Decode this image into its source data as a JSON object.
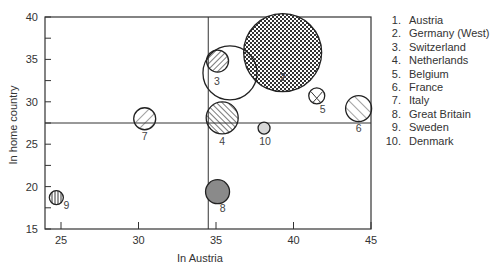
{
  "chart_data": {
    "type": "scatter",
    "subtype": "bubble",
    "title": "",
    "xlabel": "In Austria",
    "ylabel": "In home country",
    "xlim": [
      24,
      45
    ],
    "ylim": [
      15,
      40
    ],
    "xticks": [
      25,
      30,
      35,
      40,
      45
    ],
    "yticks": [
      15,
      20,
      25,
      30,
      35,
      40
    ],
    "grid": false,
    "reference_lines": {
      "x": 34.5,
      "y": 27.5
    },
    "legend_position": "right",
    "points": [
      {
        "id": 1,
        "label": "1",
        "name": "Austria",
        "x": 35.1,
        "y": 34.8,
        "r": 11,
        "pattern": "diag-hatch",
        "show_label": false
      },
      {
        "id": 2,
        "label": "2",
        "name": "Germany (West)",
        "x": 39.3,
        "y": 35.8,
        "r": 39,
        "pattern": "crosshatch",
        "show_label": true
      },
      {
        "id": 3,
        "label": "3",
        "name": "Switzerland",
        "x": 35.9,
        "y": 33.4,
        "r": 27,
        "pattern": "none",
        "show_label": true
      },
      {
        "id": 4,
        "label": "4",
        "name": "Netherlands",
        "x": 35.4,
        "y": 28.1,
        "r": 16,
        "pattern": "back-diag-hatch",
        "show_label": true
      },
      {
        "id": 5,
        "label": "5",
        "name": "Belgium",
        "x": 41.5,
        "y": 30.7,
        "r": 8,
        "pattern": "v-lines",
        "show_label": true
      },
      {
        "id": 6,
        "label": "6",
        "name": "France",
        "x": 44.2,
        "y": 29.2,
        "r": 13,
        "pattern": "sparse-back-diag",
        "show_label": true
      },
      {
        "id": 7,
        "label": "7",
        "name": "Italy",
        "x": 30.4,
        "y": 28.0,
        "r": 11,
        "pattern": "sparse-diag",
        "show_label": true
      },
      {
        "id": 8,
        "label": "8",
        "name": "Great Britain",
        "x": 35.1,
        "y": 19.4,
        "r": 12,
        "pattern": "solid-gray",
        "show_label": true
      },
      {
        "id": 9,
        "label": "9",
        "name": "Sweden",
        "x": 24.7,
        "y": 18.7,
        "r": 7,
        "pattern": "vertical-lines",
        "show_label": true
      },
      {
        "id": 10,
        "label": "10",
        "name": "Denmark",
        "x": 38.1,
        "y": 26.9,
        "r": 6,
        "pattern": "light-gray",
        "show_label": true
      }
    ]
  },
  "legend": {
    "items": [
      {
        "num": "1.",
        "name": "Austria"
      },
      {
        "num": "2.",
        "name": "Germany (West)"
      },
      {
        "num": "3.",
        "name": "Switzerland"
      },
      {
        "num": "4.",
        "name": "Netherlands"
      },
      {
        "num": "5.",
        "name": "Belgium"
      },
      {
        "num": "6.",
        "name": "France"
      },
      {
        "num": "7.",
        "name": "Italy"
      },
      {
        "num": "8.",
        "name": "Great Britain"
      },
      {
        "num": "9.",
        "name": "Sweden"
      },
      {
        "num": "10.",
        "name": "Denmark"
      }
    ]
  },
  "colors": {
    "axis": "#333333",
    "gray_fill": "#8a8a8a",
    "light_gray_fill": "#d8d8d8",
    "outline": "#222222"
  }
}
